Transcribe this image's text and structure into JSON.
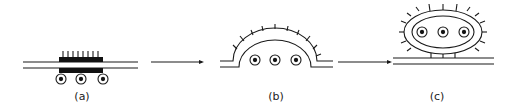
{
  "diagram": {
    "stages": [
      {
        "id": "a",
        "label": "(a)",
        "label_letter": "a",
        "state": "flat membrane with dense coat, particles below"
      },
      {
        "id": "b",
        "label": "(b)",
        "label_letter": "b",
        "state": "invaginating pit enclosing three particles"
      },
      {
        "id": "c",
        "label": "(c)",
        "label_letter": "c",
        "state": "coated vesicle pinched off above membrane"
      }
    ],
    "arrows": [
      {
        "from": "a",
        "to": "b"
      },
      {
        "from": "b",
        "to": "c"
      }
    ],
    "colors": {
      "stroke": "#1a1a1a",
      "fill": "#111111",
      "background": "#ffffff"
    }
  }
}
